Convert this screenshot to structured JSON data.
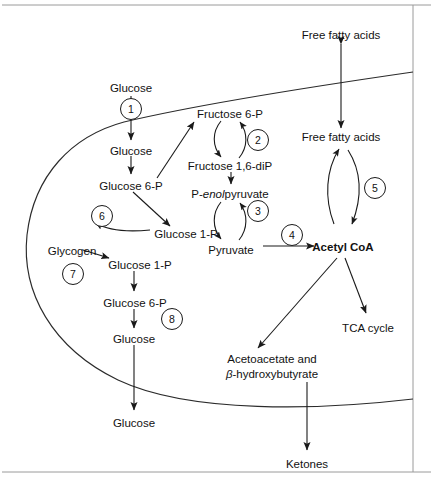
{
  "figure": {
    "background_color": "#ffffff",
    "line_color": "#1a1a1a",
    "frame_color": "#9a9a9a"
  },
  "labels": {
    "glucose_extracellular_top": "Glucose",
    "glucose_intracellular": "Glucose",
    "glucose_6p_upper": "Glucose  6-P",
    "glucose_1p_upper": "Glucose  1-P",
    "glycogen": "Glycogen",
    "glucose_1p_lower": "Glucose  1-P",
    "glucose_6p_lower": "Glucose  6-P",
    "glucose_lower_intracellular": "Glucose",
    "glucose_extracellular_bottom": "Glucose",
    "fructose_6p": "Fructose  6-P",
    "fructose_16dip": "Fructose  1,6-diP",
    "pep_prefix": "P-",
    "pep_italic": "enol",
    "pep_suffix": "pyruvate",
    "pyruvate": "Pyruvate",
    "acetyl_coa": "Acetyl CoA",
    "free_fatty_acids_extracellular": "Free fatty acids",
    "free_fatty_acids_intracellular": "Free fatty acids",
    "tca_cycle": "TCA cycle",
    "ketone_bodies_line1": "Acetoacetate and",
    "ketone_bodies_beta": "β",
    "ketone_bodies_line2": "-hydroxybutyrate",
    "ketones": "Ketones"
  },
  "enzyme_steps": [
    {
      "id": "1",
      "number": "1",
      "cx": 131,
      "cy": 109,
      "r": 10.5
    },
    {
      "id": "2",
      "number": "2",
      "cx": 258,
      "cy": 140,
      "r": 10.5
    },
    {
      "id": "3",
      "number": "3",
      "cx": 258,
      "cy": 211,
      "r": 10.5
    },
    {
      "id": "4",
      "number": "4",
      "cx": 292,
      "cy": 235,
      "r": 10.5
    },
    {
      "id": "5",
      "number": "5",
      "cx": 375,
      "cy": 188,
      "r": 10.5
    },
    {
      "id": "6",
      "number": "6",
      "cx": 102,
      "cy": 216,
      "r": 10.5
    },
    {
      "id": "7",
      "number": "7",
      "cx": 73,
      "cy": 274,
      "r": 10.5
    },
    {
      "id": "8",
      "number": "8",
      "cx": 172,
      "cy": 319,
      "r": 10.5
    }
  ],
  "text_positions": {
    "glucose_top": {
      "x": 113,
      "y": 92
    },
    "glucose_in": {
      "x": 112,
      "y": 151
    },
    "glucose6p_up": {
      "x": 106,
      "y": 186
    },
    "glucose1p_up": {
      "x": 153,
      "y": 234
    },
    "glycogen": {
      "x": 42,
      "y": 252
    },
    "glucose1p_low": {
      "x": 106,
      "y": 265
    },
    "glucose6p_low": {
      "x": 104,
      "y": 303
    },
    "glucose_low": {
      "x": 110,
      "y": 339
    },
    "glucose_bottom": {
      "x": 112,
      "y": 423
    },
    "fructose6p": {
      "x": 189,
      "y": 115
    },
    "fructose16dip": {
      "x": 183,
      "y": 167
    },
    "pep": {
      "x": 185,
      "y": 195
    },
    "pyruvate": {
      "x": 222,
      "y": 250
    },
    "acetyl_coa": {
      "x": 322,
      "y": 250
    },
    "ffa_out": {
      "x": 302,
      "y": 36
    },
    "ffa_in": {
      "x": 311,
      "y": 138
    },
    "tca": {
      "x": 335,
      "y": 330
    },
    "ketone_l1": {
      "x": 224,
      "y": 360
    },
    "ketone_l2": {
      "x": 230,
      "y": 375
    },
    "ketones": {
      "x": 288,
      "y": 466
    }
  }
}
